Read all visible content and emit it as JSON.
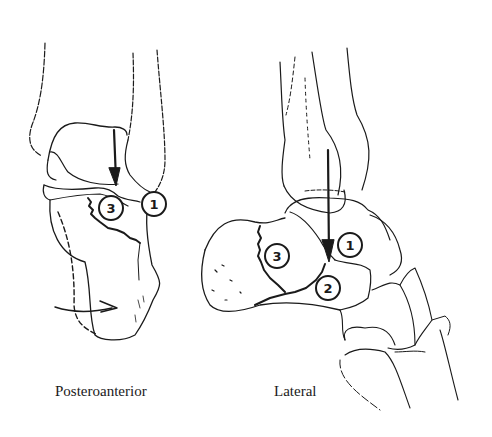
{
  "figure": {
    "views": [
      {
        "id": "posteroanterior",
        "caption": "Posteroanterior",
        "markers": [
          {
            "label": "1"
          },
          {
            "label": "3"
          }
        ]
      },
      {
        "id": "lateral",
        "caption": "Lateral",
        "markers": [
          {
            "label": "1"
          },
          {
            "label": "2"
          },
          {
            "label": "3"
          }
        ]
      }
    ],
    "colors": {
      "line": "#1a1a1a",
      "background": "#ffffff"
    }
  }
}
